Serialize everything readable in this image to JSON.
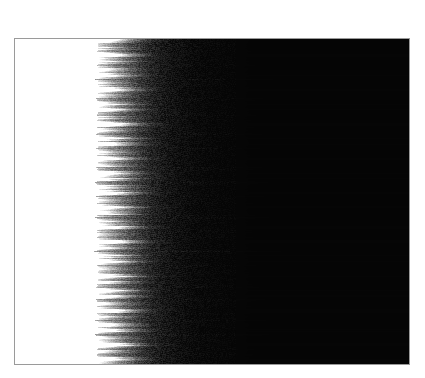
{
  "image": {
    "title": "Grayscale scan-line density field",
    "kind": "raster-field",
    "width_px": 425,
    "height_px": 378,
    "background_color": "#ffffff"
  },
  "plate": {
    "name": "bordered-plate",
    "left_px": 14,
    "top_px": 38,
    "width_px": 396,
    "height_px": 327,
    "border_color": "#9a9a9a",
    "border_width_px": 1
  },
  "field": {
    "name": "scan-line-density-field",
    "light_region_color": "#ffffff",
    "dark_region_color": "#050505",
    "light_region_end_frac": 0.215,
    "transition_start_frac": 0.215,
    "transition_end_frac": 0.355,
    "streak_fadeout_frac": 0.56,
    "line_height_px": 1,
    "line_count": 327,
    "orientation": "horizontal",
    "noise_amount": 0.16,
    "description": "Solid white block on the left, a narrow turbulent horizontal-streak transition band, then a solid black field filling the right two-thirds."
  },
  "chart_data": {
    "type": "heatmap",
    "xlabel": "",
    "ylabel": "",
    "orientation": "horizontal-scanlines",
    "colormap": "grayscale",
    "value_range": [
      0,
      255
    ],
    "x": [
      0.0,
      0.1,
      0.2,
      0.215,
      0.24,
      0.27,
      0.3,
      0.33,
      0.36,
      0.4,
      0.45,
      0.5,
      0.6,
      0.7,
      0.8,
      0.9,
      1.0
    ],
    "mean_intensity": [
      255,
      255,
      255,
      250,
      196,
      138,
      92,
      58,
      36,
      22,
      14,
      9,
      6,
      5,
      5,
      5,
      5
    ],
    "row_variability": [
      0,
      0,
      0,
      0.05,
      0.34,
      0.52,
      0.58,
      0.55,
      0.47,
      0.36,
      0.26,
      0.18,
      0.09,
      0.05,
      0.03,
      0.02,
      0.02
    ]
  }
}
